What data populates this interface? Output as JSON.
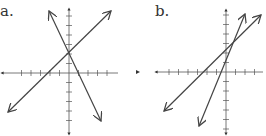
{
  "graphs": [
    {
      "label": "a.",
      "axes": {
        "origin": [
          69,
          73
        ],
        "x_range": [
          2,
          118
        ],
        "y_range": [
          9,
          134
        ],
        "tick_spacing": 9.5
      },
      "lines": [
        {
          "from": [
            8,
            112
          ],
          "to": [
            111,
            11
          ]
        },
        {
          "from": [
            49,
            11
          ],
          "to": [
            101,
            121
          ]
        }
      ]
    },
    {
      "label": "b.",
      "axes": {
        "origin": [
          226,
          72
        ],
        "x_range": [
          156,
          263
        ],
        "y_range": [
          10,
          134
        ],
        "tick_spacing": 9.5,
        "stray_arrow_x": 137
      },
      "lines": [
        {
          "from": [
            164,
            111
          ],
          "to": [
            261,
            15
          ]
        },
        {
          "from": [
            199,
            126
          ],
          "to": [
            245,
            14
          ]
        }
      ]
    }
  ],
  "colors": {
    "axis": "#555555",
    "line": "#444444",
    "label": "#333333"
  }
}
